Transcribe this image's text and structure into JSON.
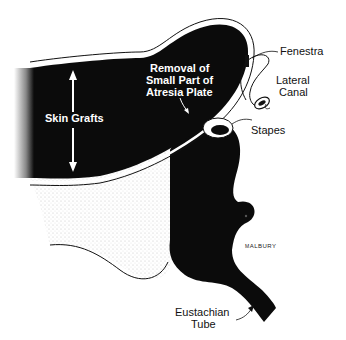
{
  "figure": {
    "type": "anatomical illustration",
    "colors": {
      "fill": "#0b0b0b",
      "background": "#ffffff",
      "outline": "#111111",
      "stipple": "#d8d8d8"
    }
  },
  "labels": {
    "skin_grafts": "Skin Grafts",
    "removal_line1": "Removal of",
    "removal_line2": "Small Part of",
    "removal_line3": "Atresia Plate",
    "fenestra": "Fenestra",
    "lateral_line1": "Lateral",
    "lateral_line2": "Canal",
    "stapes": "Stapes",
    "eustachian_line1": "Eustachian",
    "eustachian_line2": "Tube"
  },
  "signature": {
    "initials": "M",
    "name": "ALBURY"
  }
}
